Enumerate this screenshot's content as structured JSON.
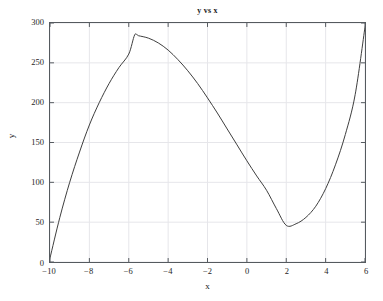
{
  "chart_data": {
    "type": "line",
    "title": "y vs x",
    "xlabel": "x",
    "ylabel": "y",
    "xlim": [
      -10,
      6
    ],
    "ylim": [
      0,
      300
    ],
    "grid": true,
    "legend": null,
    "x_ticks": [
      "-10",
      "-8",
      "-6",
      "-4",
      "-2",
      "0",
      "2",
      "4",
      "6"
    ],
    "x_tick_values": [
      -10,
      -8,
      -6,
      -4,
      -2,
      0,
      2,
      4,
      6
    ],
    "y_ticks": [
      "0",
      "50",
      "100",
      "150",
      "200",
      "250",
      "300"
    ],
    "y_tick_values": [
      0,
      50,
      100,
      150,
      200,
      250,
      300
    ],
    "line_color": "#3c3c3c",
    "line_width": 1,
    "axis_color": "#555a5f",
    "grid_color": "#e6e6ea",
    "background": "#ffffff",
    "annotations": {
      "local_maximum": {
        "x": -5.7,
        "y": 285
      },
      "local_minimum": {
        "x": 2.0,
        "y": 46
      },
      "start_point": {
        "x": -10,
        "y": 5
      },
      "end_point": {
        "x": 6,
        "y": 295
      }
    },
    "series": [
      {
        "name": "y",
        "x": [
          -10.0,
          -9.75,
          -9.5,
          -9.25,
          -9.0,
          -8.75,
          -8.5,
          -8.25,
          -8.0,
          -7.75,
          -7.5,
          -7.25,
          -7.0,
          -6.75,
          -6.5,
          -6.25,
          -6.0,
          -5.75,
          -5.5,
          -5.25,
          -5.0,
          -4.75,
          -4.5,
          -4.25,
          -4.0,
          -3.75,
          -3.5,
          -3.25,
          -3.0,
          -2.75,
          -2.5,
          -2.25,
          -2.0,
          -1.75,
          -1.5,
          -1.25,
          -1.0,
          -0.75,
          -0.5,
          -0.25,
          0.0,
          0.25,
          0.5,
          0.75,
          1.0,
          1.25,
          1.5,
          1.75,
          2.0,
          2.25,
          2.5,
          2.75,
          3.0,
          3.25,
          3.5,
          3.75,
          4.0,
          4.25,
          4.5,
          4.75,
          5.0,
          5.25,
          5.5,
          5.75,
          6.0
        ],
        "y": [
          5.0,
          29.7,
          52.9,
          74.6,
          94.9,
          113.7,
          131.1,
          147.1,
          161.8,
          175.1,
          187.1,
          197.7,
          207.1,
          215.2,
          222.1,
          227.7,
          232.2,
          235.5,
          237.6,
          238.7,
          238.6,
          237.5,
          235.4,
          232.2,
          228.0,
          222.9,
          216.8,
          209.9,
          202.0,
          193.3,
          183.7,
          173.4,
          162.3,
          150.4,
          137.8,
          124.6,
          110.7,
          96.2,
          81.1,
          65.4,
          49.2,
          32.5,
          15.3,
          2.3,
          13.7,
          24.7,
          35.3,
          43.5,
          46.0,
          48.2,
          54.9,
          66.0,
          81.5,
          101.4,
          125.6,
          154.2,
          187.1,
          224.4,
          266.1,
          312.1,
          362.5,
          417.2,
          476.3,
          539.8,
          295.0
        ]
      }
    ],
    "curve_path_points": [
      [
        -10.0,
        5.0
      ],
      [
        -9.5,
        56.0
      ],
      [
        -9.0,
        100.0
      ],
      [
        -8.5,
        138.0
      ],
      [
        -8.0,
        172.0
      ],
      [
        -7.5,
        200.0
      ],
      [
        -7.0,
        224.0
      ],
      [
        -6.5,
        244.0
      ],
      [
        -6.0,
        261.0
      ],
      [
        -5.7,
        285.0
      ],
      [
        -5.5,
        284.0
      ],
      [
        -5.0,
        281.0
      ],
      [
        -4.5,
        275.0
      ],
      [
        -4.0,
        266.0
      ],
      [
        -3.5,
        254.0
      ],
      [
        -3.0,
        240.0
      ],
      [
        -2.5,
        224.0
      ],
      [
        -2.0,
        206.0
      ],
      [
        -1.5,
        187.0
      ],
      [
        -1.0,
        167.0
      ],
      [
        -0.5,
        147.0
      ],
      [
        0.0,
        127.0
      ],
      [
        0.5,
        108.0
      ],
      [
        1.0,
        90.0
      ],
      [
        1.5,
        67.0
      ],
      [
        2.0,
        46.0
      ],
      [
        2.5,
        48.0
      ],
      [
        3.0,
        56.0
      ],
      [
        3.5,
        70.0
      ],
      [
        4.0,
        92.0
      ],
      [
        4.5,
        122.0
      ],
      [
        5.0,
        160.0
      ],
      [
        5.5,
        210.0
      ],
      [
        6.0,
        295.0
      ]
    ]
  }
}
